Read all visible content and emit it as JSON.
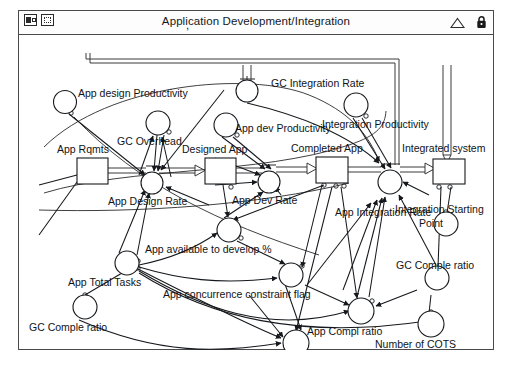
{
  "window": {
    "title": "Application Development/Integration",
    "title_prefix_comma": ",",
    "icons": {
      "view_icon": "view-mode-icon",
      "select_icon": "marquee-select-icon",
      "collapse_icon": "triangle-collapse-icon",
      "lock_icon": "lock-icon"
    }
  },
  "diagram": {
    "type": "system-dynamics-stock-flow",
    "stocks": [
      {
        "id": "app_rqmts",
        "label": "App Rqmts",
        "x": 58,
        "y": 123,
        "w": 31,
        "h": 26,
        "label_x": 38,
        "label_y": 118
      },
      {
        "id": "designed_app",
        "label": "Designed App",
        "x": 186,
        "y": 123,
        "w": 31,
        "h": 26,
        "label_x": 163,
        "label_y": 118
      },
      {
        "id": "completed_app",
        "label": "Completed App",
        "x": 297,
        "y": 122,
        "w": 32,
        "h": 26,
        "label_x": 273,
        "label_y": 117
      },
      {
        "id": "integrated_system",
        "label": "Integrated system",
        "x": 414,
        "y": 124,
        "w": 32,
        "h": 25,
        "label_x": 383,
        "label_y": 117
      }
    ],
    "rates": [
      {
        "id": "app_design_rate",
        "label": "App Design Rate",
        "cx": 133,
        "cy": 148,
        "r": 11,
        "label_x": 89,
        "label_y": 168
      },
      {
        "id": "app_dev_rate",
        "label": "App Dev Rate",
        "cx": 250,
        "cy": 147,
        "r": 11,
        "label_x": 213,
        "label_y": 168
      },
      {
        "id": "app_integration_rate",
        "label": "App Integration Rate",
        "cx": 371,
        "cy": 147,
        "r": 12,
        "label_x": 318,
        "label_y": 180
      },
      {
        "id": "gc_integration_rate",
        "label": "GC Integration Rate",
        "cx": 228,
        "cy": 56,
        "r": 11,
        "label_x": 253,
        "label_y": 51
      }
    ],
    "variables": [
      {
        "id": "app_design_productivity",
        "label": "App design Productivity",
        "cx": 46,
        "cy": 67,
        "r": 11.5,
        "label_x": 60,
        "label_y": 60
      },
      {
        "id": "gc_overhead",
        "label": "GC Overhead",
        "cx": 139,
        "cy": 88,
        "r": 12,
        "label_x": 99,
        "label_y": 108
      },
      {
        "id": "app_dev_productivity",
        "label": "App dev Productivity",
        "cx": 207,
        "cy": 90,
        "r": 12,
        "label_x": 216,
        "label_y": 96
      },
      {
        "id": "integration_productivity",
        "label": "Integration Productivity",
        "cx": 337,
        "cy": 70,
        "r": 12,
        "label_x": 318,
        "label_y": 92
      },
      {
        "id": "app_available_to_develop",
        "label": "App available to develop %",
        "cx": 210,
        "cy": 195,
        "r": 12,
        "label_x": 143,
        "label_y": 217
      },
      {
        "id": "app_concurrence_flag",
        "label": "App concurrence constraint flag",
        "cx": 272,
        "cy": 240,
        "r": 12,
        "label_x": 169,
        "label_y": 262
      },
      {
        "id": "app_total_tasks",
        "label": "App Total Tasks",
        "cx": 108,
        "cy": 228,
        "r": 12,
        "label_x": 68,
        "label_y": 250
      },
      {
        "id": "gc_comple_ratio_left",
        "label": "GC Comple ratio",
        "cx": 66,
        "cy": 272,
        "r": 12,
        "label_x": 27,
        "label_y": 295
      },
      {
        "id": "integration_starting_pt",
        "label": "Integration Starting Point",
        "cx": 427,
        "cy": 189,
        "r": 12,
        "label_x": 391,
        "label_y": 209
      },
      {
        "id": "integration_starting_pt_line2",
        "label": "Point",
        "cx": 0,
        "cy": 0,
        "r": 0,
        "label_x": 413,
        "label_y": 222
      },
      {
        "id": "gc_comple_ratio_right",
        "label": "GC Comple ratio",
        "cx": 418,
        "cy": 243,
        "r": 12,
        "label_x": 392,
        "label_y": 266
      },
      {
        "id": "app_compl_ratio",
        "label": "App Compl ratio",
        "cx": 342,
        "cy": 276,
        "r": 13,
        "label_x": 303,
        "label_y": 299
      },
      {
        "id": "number_of_cots",
        "label": "Number of COTS",
        "cx": 412,
        "cy": 289,
        "r": 13,
        "label_x": 371,
        "label_y": 312
      },
      {
        "id": "stop",
        "label": "STOP",
        "cx": 277,
        "cy": 308,
        "r": 13,
        "label_x": 260,
        "label_y": 331
      }
    ],
    "labels": {
      "app_design_productivity": "App design Productivity",
      "gc_integration_rate": "GC Integration Rate",
      "gc_overhead": "GC Overhead",
      "app_dev_productivity": "App dev Productivity",
      "integration_productivity": "Integration Productivity",
      "app_rqmts": "App Rqmts",
      "designed_app": "Designed App",
      "completed_app": "Completed App",
      "integrated_system": "Integrated system",
      "app_design_rate": "App Design Rate",
      "app_dev_rate": "App Dev Rate",
      "app_integration_rate": "App Integration Rate",
      "app_available_to_develop": "App available to develop %",
      "integration_starting_point_l1": "Integration Starting",
      "integration_starting_point_l2": "Point",
      "app_total_tasks": "App Total Tasks",
      "app_concurrence_flag": "App concurrence constraint flag",
      "gc_comple_ratio_left": "GC Comple ratio",
      "gc_comple_ratio_right": "GC Comple ratio",
      "app_compl_ratio": "App Compl ratio",
      "number_of_cots": "Number of COTS",
      "stop": "STOP"
    }
  }
}
